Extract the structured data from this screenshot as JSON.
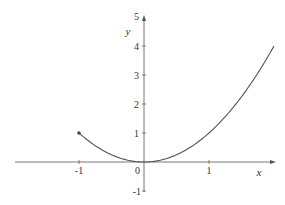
{
  "chart_data": {
    "type": "line",
    "title": "",
    "xlabel": "x",
    "ylabel": "y",
    "function": "y = x^2",
    "domain": [
      -1,
      2
    ],
    "xlim": [
      -2.0,
      2.0
    ],
    "ylim": [
      -1,
      5
    ],
    "x_ticks": [
      -1,
      0,
      1
    ],
    "y_ticks": [
      -1,
      1,
      2,
      3,
      4,
      5
    ],
    "grid": false,
    "legend": null,
    "series": [
      {
        "name": "y = x^2",
        "x": [
          -1,
          -0.5,
          0,
          0.5,
          1,
          1.5,
          2
        ],
        "values": [
          1,
          0.25,
          0,
          0.25,
          1,
          2.25,
          4
        ]
      }
    ],
    "annotations": [
      {
        "type": "filled-endpoint",
        "x": -1,
        "y": 1
      }
    ],
    "colors": {
      "axis": "#555555",
      "curve": "#555555",
      "text": "#333333"
    }
  },
  "labels": {
    "x_axis": "x",
    "y_axis": "y",
    "origin": "0",
    "x_ticks": [
      "-1",
      "1"
    ],
    "y_ticks": [
      "1",
      "2",
      "3",
      "4",
      "5",
      "-1"
    ]
  }
}
